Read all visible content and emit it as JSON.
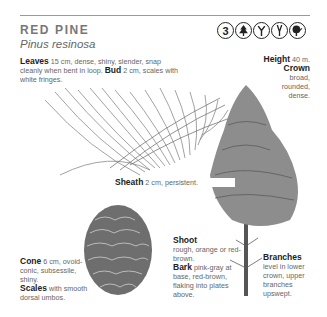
{
  "header": {
    "common_name": "RED PINE",
    "scientific_name": "Pinus resinosa",
    "icons": [
      {
        "name": "zone-3-badge",
        "text": "3"
      },
      {
        "name": "conifer-tree-icon",
        "text": ""
      },
      {
        "name": "fork-branch-icon",
        "text": ""
      },
      {
        "name": "narrow-branch-icon",
        "text": ""
      },
      {
        "name": "leaf-tree-icon",
        "text": ""
      }
    ]
  },
  "annotations": {
    "leaves": {
      "label": "Leaves",
      "text": " 15 cm, dense, shiny, slender, snap cleanly when bent in loop. "
    },
    "bud": {
      "label": "Bud",
      "text": " 2 cm, scales with white fringes."
    },
    "height": {
      "label": "Height",
      "text": " 40 m."
    },
    "crown": {
      "label": "Crown",
      "text": "broad, rounded, dense."
    },
    "sheath": {
      "label": "Sheath",
      "text": " 2 cm, persistent."
    },
    "cone": {
      "label": "Cone",
      "text": " 6 cm, ovoid-conic, subsessile, shiny."
    },
    "scales": {
      "label": "Scales",
      "text": " with smooth dorsal umbos."
    },
    "shoot": {
      "label": "Shoot",
      "text": "rough, orange or red-brown."
    },
    "bark": {
      "label": "Bark",
      "text": " pink-gray at base, red-brown, flaking into plates above."
    },
    "branches": {
      "label": "Branches",
      "text": "level in lower crown, upper branches upswept."
    }
  }
}
